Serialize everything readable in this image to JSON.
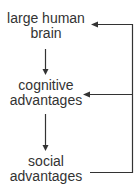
{
  "diagram": {
    "type": "flow",
    "nodes": [
      {
        "id": "brain",
        "lines": [
          "large human",
          "brain"
        ]
      },
      {
        "id": "cognitive",
        "lines": [
          "cognitive",
          "advantages"
        ]
      },
      {
        "id": "social",
        "lines": [
          "social",
          "advantages"
        ]
      }
    ],
    "edges": [
      {
        "from": "brain",
        "to": "cognitive",
        "kind": "down-arrow"
      },
      {
        "from": "cognitive",
        "to": "social",
        "kind": "down-arrow"
      },
      {
        "from": "social",
        "to": "cognitive",
        "kind": "feedback-arrow"
      },
      {
        "from": "social",
        "to": "brain",
        "kind": "feedback-arrow"
      }
    ],
    "colors": {
      "line": "#333333",
      "text": "#333333",
      "background": "#ffffff"
    }
  }
}
